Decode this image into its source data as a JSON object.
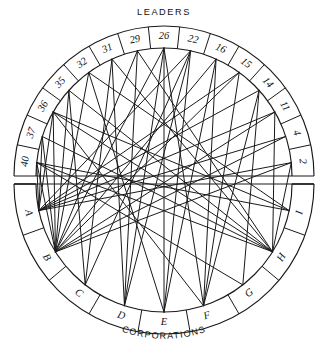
{
  "figure": {
    "name": "leaders-corporations-sociogram",
    "top_title": "LEADERS",
    "bottom_title": "CORPORATIONS",
    "width": 328,
    "height": 357,
    "ink_color": "#1a1a1a",
    "background_color": "#ffffff"
  },
  "chart_data": {
    "type": "network",
    "title": "LEADERS",
    "subtitle": "CORPORATIONS",
    "layout": "circular bipartite chord diagram, split by a horizontal band across the middle",
    "grid": false,
    "legend": "none",
    "groups": [
      {
        "name": "LEADERS",
        "label": "LEADERS",
        "half": "top",
        "nodes": [
          "40",
          "37",
          "36",
          "35",
          "32",
          "31",
          "29",
          "26",
          "22",
          "16",
          "15",
          "14",
          "11",
          "4",
          "2"
        ]
      },
      {
        "name": "CORPORATIONS",
        "label": "CORPORATIONS",
        "half": "bottom",
        "nodes": [
          "A",
          "B",
          "C",
          "D",
          "E",
          "F",
          "G",
          "H",
          "I"
        ]
      }
    ],
    "nodes": [
      {
        "id": "40",
        "label": "40",
        "group": "LEADERS",
        "angle_deg": 186
      },
      {
        "id": "37",
        "label": "37",
        "group": "LEADERS",
        "angle_deg": 198
      },
      {
        "id": "36",
        "label": "36",
        "group": "LEADERS",
        "angle_deg": 210
      },
      {
        "id": "35",
        "label": "35",
        "group": "LEADERS",
        "angle_deg": 222
      },
      {
        "id": "32",
        "label": "32",
        "group": "LEADERS",
        "angle_deg": 234
      },
      {
        "id": "31",
        "label": "31",
        "group": "LEADERS",
        "angle_deg": 246
      },
      {
        "id": "29",
        "label": "29",
        "group": "LEADERS",
        "angle_deg": 258
      },
      {
        "id": "26",
        "label": "26",
        "group": "LEADERS",
        "angle_deg": 270
      },
      {
        "id": "22",
        "label": "22",
        "group": "LEADERS",
        "angle_deg": 282
      },
      {
        "id": "16",
        "label": "16",
        "group": "LEADERS",
        "angle_deg": 294
      },
      {
        "id": "15",
        "label": "15",
        "group": "LEADERS",
        "angle_deg": 306
      },
      {
        "id": "14",
        "label": "14",
        "group": "LEADERS",
        "angle_deg": 318
      },
      {
        "id": "11",
        "label": "11",
        "group": "LEADERS",
        "angle_deg": 330
      },
      {
        "id": "4",
        "label": "4",
        "group": "LEADERS",
        "angle_deg": 342
      },
      {
        "id": "2",
        "label": "2",
        "group": "LEADERS",
        "angle_deg": 354
      },
      {
        "id": "I",
        "label": "I",
        "group": "CORPORATIONS",
        "angle_deg": 12
      },
      {
        "id": "H",
        "label": "H",
        "group": "CORPORATIONS",
        "angle_deg": 32
      },
      {
        "id": "G",
        "label": "G",
        "group": "CORPORATIONS",
        "angle_deg": 52
      },
      {
        "id": "F",
        "label": "F",
        "group": "CORPORATIONS",
        "angle_deg": 72
      },
      {
        "id": "E",
        "label": "E",
        "group": "CORPORATIONS",
        "angle_deg": 90
      },
      {
        "id": "D",
        "label": "D",
        "group": "CORPORATIONS",
        "angle_deg": 108
      },
      {
        "id": "C",
        "label": "C",
        "group": "CORPORATIONS",
        "angle_deg": 128
      },
      {
        "id": "B",
        "label": "B",
        "group": "CORPORATIONS",
        "angle_deg": 148
      },
      {
        "id": "A",
        "label": "A",
        "group": "CORPORATIONS",
        "angle_deg": 168
      }
    ],
    "edges": [
      {
        "from": "40",
        "to": "A"
      },
      {
        "from": "40",
        "to": "B"
      },
      {
        "from": "40",
        "to": "H"
      },
      {
        "from": "40",
        "to": "I"
      },
      {
        "from": "40",
        "to": "G"
      },
      {
        "from": "37",
        "to": "A"
      },
      {
        "from": "37",
        "to": "B"
      },
      {
        "from": "37",
        "to": "H"
      },
      {
        "from": "36",
        "to": "A"
      },
      {
        "from": "36",
        "to": "B"
      },
      {
        "from": "36",
        "to": "F"
      },
      {
        "from": "36",
        "to": "H"
      },
      {
        "from": "35",
        "to": "B"
      },
      {
        "from": "35",
        "to": "C"
      },
      {
        "from": "32",
        "to": "B"
      },
      {
        "from": "32",
        "to": "E"
      },
      {
        "from": "31",
        "to": "C"
      },
      {
        "from": "31",
        "to": "D"
      },
      {
        "from": "29",
        "to": "D"
      },
      {
        "from": "29",
        "to": "B"
      },
      {
        "from": "26",
        "to": "B"
      },
      {
        "from": "26",
        "to": "E"
      },
      {
        "from": "26",
        "to": "F"
      },
      {
        "from": "22",
        "to": "C"
      },
      {
        "from": "22",
        "to": "E"
      },
      {
        "from": "22",
        "to": "A"
      },
      {
        "from": "16",
        "to": "F"
      },
      {
        "from": "16",
        "to": "E"
      },
      {
        "from": "15",
        "to": "F"
      },
      {
        "from": "15",
        "to": "A"
      },
      {
        "from": "14",
        "to": "G"
      },
      {
        "from": "14",
        "to": "F"
      },
      {
        "from": "14",
        "to": "A"
      },
      {
        "from": "11",
        "to": "B"
      },
      {
        "from": "11",
        "to": "H"
      },
      {
        "from": "4",
        "to": "A"
      },
      {
        "from": "4",
        "to": "B"
      },
      {
        "from": "2",
        "to": "A"
      },
      {
        "from": "2",
        "to": "B"
      },
      {
        "from": "2",
        "to": "H"
      },
      {
        "from": "29",
        "to": "H"
      },
      {
        "from": "31",
        "to": "H"
      },
      {
        "from": "26",
        "to": "D"
      },
      {
        "from": "22",
        "to": "D"
      },
      {
        "from": "35",
        "to": "H"
      },
      {
        "from": "32",
        "to": "I"
      },
      {
        "from": "36",
        "to": "I"
      },
      {
        "from": "16",
        "to": "B"
      },
      {
        "from": "15",
        "to": "B"
      },
      {
        "from": "11",
        "to": "A"
      }
    ]
  }
}
